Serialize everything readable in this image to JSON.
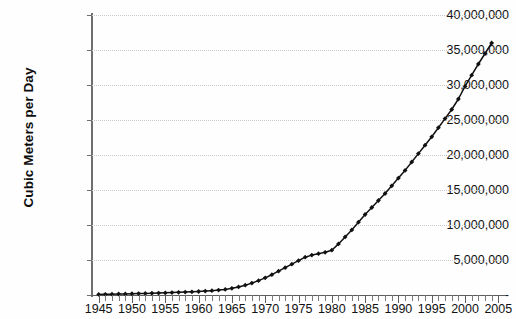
{
  "chart_data": {
    "type": "line",
    "title": "",
    "xlabel": "",
    "ylabel": "Cubic Meters per Day",
    "xlim": [
      1944,
      2006
    ],
    "ylim": [
      0,
      40000000
    ],
    "grid": true,
    "legend": null,
    "y_tick_labels": [
      "40,000,000",
      "35,000,000",
      "30,000,000",
      "25,000,000",
      "20,000,000",
      "15,000,000",
      "10,000,000",
      "5,000,000",
      "-"
    ],
    "y_tick_values": [
      40000000,
      35000000,
      30000000,
      25000000,
      20000000,
      15000000,
      10000000,
      5000000,
      0
    ],
    "x_tick_labels": [
      "1945",
      "1950",
      "1955",
      "1960",
      "1965",
      "1970",
      "1975",
      "1980",
      "1985",
      "1990",
      "1995",
      "2000",
      "2005"
    ],
    "x_tick_values": [
      1945,
      1950,
      1955,
      1960,
      1965,
      1970,
      1975,
      1980,
      1985,
      1990,
      1995,
      2000,
      2005
    ],
    "marker": "diamond",
    "line_color": "#111111",
    "grid_color": "#c9c9c9",
    "axis_color": "#6e6e6e",
    "x": [
      1945,
      1946,
      1947,
      1948,
      1949,
      1950,
      1951,
      1952,
      1953,
      1954,
      1955,
      1956,
      1957,
      1958,
      1959,
      1960,
      1961,
      1962,
      1963,
      1964,
      1965,
      1966,
      1967,
      1968,
      1969,
      1970,
      1971,
      1972,
      1973,
      1974,
      1975,
      1976,
      1977,
      1978,
      1979,
      1980,
      1981,
      1982,
      1983,
      1984,
      1985,
      1986,
      1987,
      1988,
      1989,
      1990,
      1991,
      1992,
      1993,
      1994,
      1995,
      1996,
      1997,
      1998,
      1999,
      2000,
      2001,
      2002,
      2003,
      2004
    ],
    "values": [
      80000,
      100000,
      120000,
      140000,
      160000,
      180000,
      200000,
      220000,
      250000,
      280000,
      310000,
      340000,
      380000,
      420000,
      460000,
      500000,
      560000,
      620000,
      700000,
      800000,
      950000,
      1150000,
      1400000,
      1700000,
      2050000,
      2450000,
      2900000,
      3400000,
      3900000,
      4400000,
      4900000,
      5400000,
      5700000,
      5900000,
      6100000,
      6400000,
      7300000,
      8300000,
      9300000,
      10400000,
      11500000,
      12500000,
      13500000,
      14500000,
      15600000,
      16700000,
      17800000,
      19000000,
      20200000,
      21400000,
      22600000,
      23900000,
      25200000,
      26500000,
      28000000,
      29800000,
      31400000,
      33000000,
      34500000,
      36000000
    ]
  }
}
